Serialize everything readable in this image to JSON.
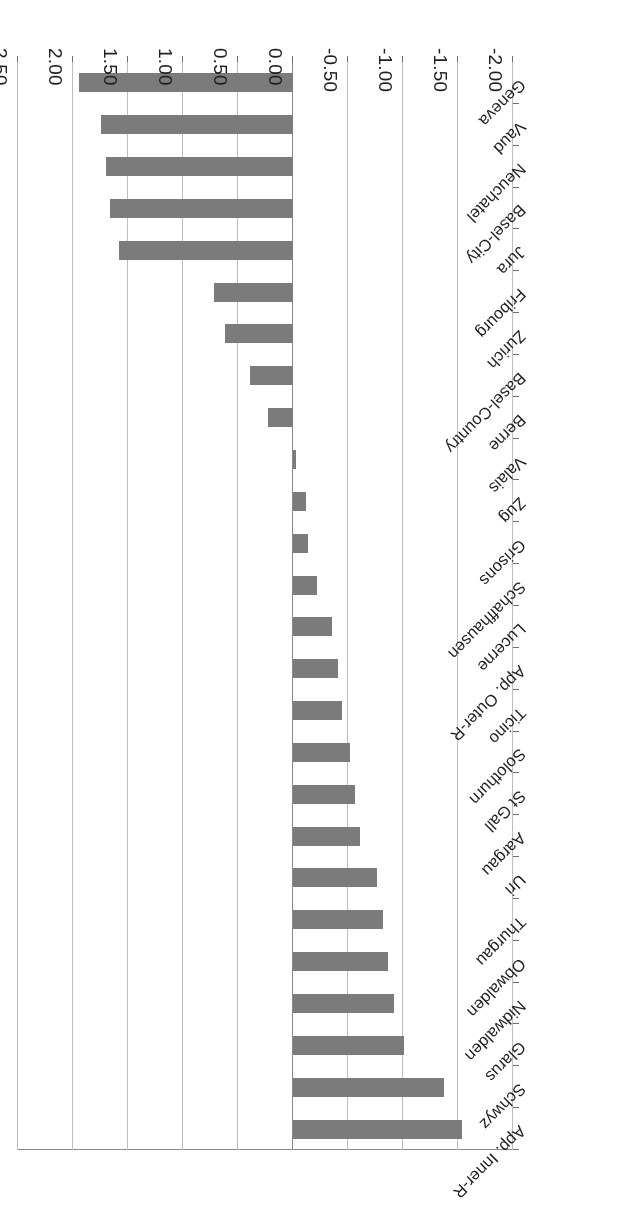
{
  "chart_data": {
    "type": "bar",
    "orientation": "horizontal",
    "title": "",
    "subtitle": "",
    "xlabel": "",
    "ylabel": "",
    "xlim": [
      -2.0,
      2.5
    ],
    "xticks": [
      "2.50",
      "2.00",
      "1.50",
      "1.00",
      "0.50",
      "0.00",
      "-0.50",
      "-1.00",
      "-1.50",
      "-2.00"
    ],
    "xtick_values": [
      2.5,
      2.0,
      1.5,
      1.0,
      0.5,
      0.0,
      -0.5,
      -1.0,
      -1.5,
      -2.0
    ],
    "grid": true,
    "legend": false,
    "rotation_deg": 180,
    "bar_color": "#7b7b7b",
    "grid_color": "#bdbdbd",
    "axis_color": "#6e6e6e",
    "categories": [
      "Geneva",
      "Vaud",
      "Neuchatel",
      "Basel-City",
      "Jura",
      "Fribourg",
      "Zurich",
      "Basel-Country",
      "Berne",
      "Valais",
      "Zug",
      "Grisons",
      "Schaffhausen",
      "Lucerne",
      "App. Outer-R",
      "Ticino",
      "Solothurn",
      "St Gall",
      "Aargau",
      "Uri",
      "Thurgau",
      "Obwalden",
      "Nidwalden",
      "Glarus",
      "Schwyz",
      "App. Inner-R"
    ],
    "values": [
      1.94,
      1.74,
      1.7,
      1.66,
      1.58,
      0.72,
      0.62,
      0.39,
      0.23,
      -0.03,
      -0.12,
      -0.14,
      -0.22,
      -0.35,
      -0.41,
      -0.44,
      -0.52,
      -0.56,
      -0.61,
      -0.76,
      -0.82,
      -0.86,
      -0.92,
      -1.01,
      -1.37,
      -1.53
    ]
  }
}
